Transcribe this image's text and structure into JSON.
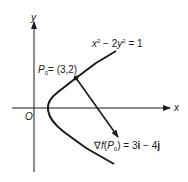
{
  "figure": {
    "axes": {
      "x_label": "x",
      "y_label": "y",
      "origin_label": "O"
    },
    "curve": {
      "equation_lhs_x": "x",
      "equation_sup_1": "2",
      "equation_mid": " − 2",
      "equation_y": "y",
      "equation_sup_2": "2",
      "equation_rhs": " = 1"
    },
    "point": {
      "name": "P",
      "subscript": "0",
      "value": "= (3,2)"
    },
    "gradient": {
      "nabla": "∇",
      "f": "f",
      "open": "(",
      "p": "P",
      "p_sub": "0",
      "close": ")",
      "equals": " = 3",
      "i": "i",
      "minus": " − 4",
      "j": "j"
    },
    "colors": {
      "ink": "#1a1a1a",
      "background": "#ffffff"
    }
  }
}
